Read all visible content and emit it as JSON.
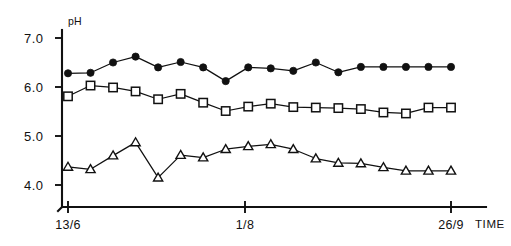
{
  "chart_data": {
    "type": "line",
    "title": "",
    "subtitle": "",
    "xlabel": "TIME",
    "ylabel": "pH",
    "ylim": [
      3.55,
      7.25
    ],
    "yticks": [
      7.0,
      6.0,
      5.0,
      4.0
    ],
    "ytick_labels": [
      "7.0",
      "6.0",
      "5.0",
      "4.0"
    ],
    "x": [
      1,
      2,
      3,
      4,
      5,
      6,
      7,
      8,
      9,
      10,
      11,
      12,
      13,
      14,
      15,
      16,
      17,
      18
    ],
    "xlim": [
      0.45,
      18.55
    ],
    "xticks": [
      1,
      10,
      18
    ],
    "xtick_labels": [
      "13/6",
      "1/8",
      "26/9"
    ],
    "grid": false,
    "legend": "none",
    "series": [
      {
        "name": "filled-circle",
        "marker": "filled circle",
        "values": [
          6.28,
          6.29,
          6.5,
          6.62,
          6.4,
          6.51,
          6.4,
          6.12,
          6.4,
          6.38,
          6.33,
          6.5,
          6.3,
          6.41,
          6.41,
          6.41,
          6.41,
          6.41
        ]
      },
      {
        "name": "open-square",
        "marker": "open square",
        "values": [
          5.81,
          6.03,
          5.99,
          5.91,
          5.75,
          5.86,
          5.68,
          5.51,
          5.6,
          5.66,
          5.59,
          5.58,
          5.57,
          5.55,
          5.48,
          5.46,
          5.58,
          5.58
        ]
      },
      {
        "name": "open-triangle",
        "marker": "open triangle",
        "values": [
          4.37,
          4.32,
          4.6,
          4.87,
          4.15,
          4.61,
          4.56,
          4.73,
          4.79,
          4.83,
          4.73,
          4.54,
          4.45,
          4.44,
          4.36,
          4.29,
          4.29,
          4.29
        ]
      }
    ],
    "series_point_counts": [
      18,
      18,
      18
    ],
    "axis_label_name": "TIME",
    "yaxis_label_name": "pH"
  },
  "axis": {
    "ylabel": "pH",
    "xaxis_name": "TIME",
    "ytick_labels": [
      "7.0",
      "6.0",
      "5.0",
      "4.0"
    ],
    "xtick_labels": [
      "13/6",
      "1/8",
      "26/9"
    ]
  }
}
